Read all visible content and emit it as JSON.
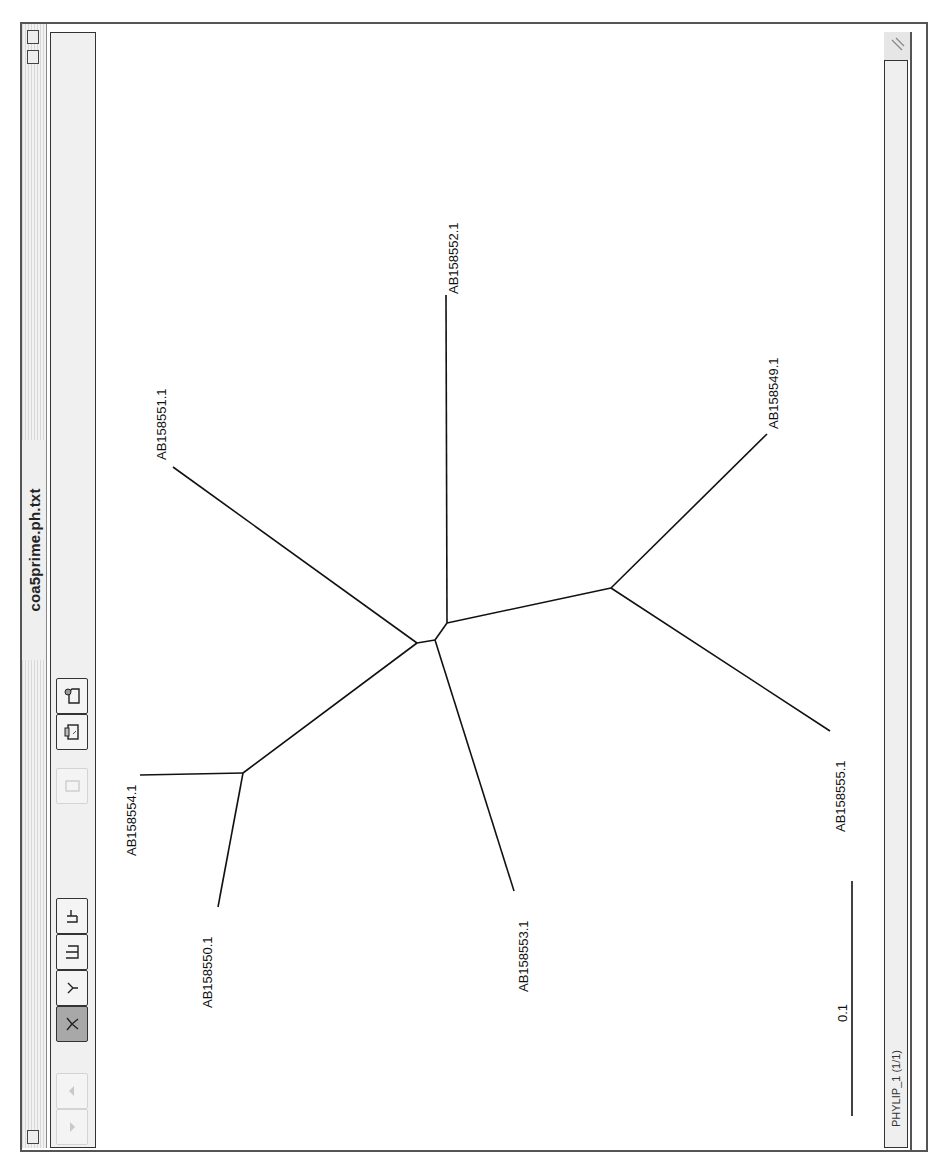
{
  "window": {
    "title": "coa5prime.ph.txt",
    "orientation": "rotated 90deg clockwise"
  },
  "toolbar": {
    "buttons": [
      {
        "name": "scroll-up",
        "icon": "triangle-up-icon",
        "state": "disabled"
      },
      {
        "name": "scroll-down",
        "icon": "triangle-down-icon",
        "state": "disabled"
      },
      {
        "name": "unrooted-tree-view",
        "icon": "unrooted-tree-icon",
        "state": "active"
      },
      {
        "name": "radial-tree-view",
        "icon": "radial-tree-icon",
        "state": "normal"
      },
      {
        "name": "rectangular-tree-view",
        "icon": "rectangle-tree-icon",
        "state": "normal"
      },
      {
        "name": "slanted-tree-view",
        "icon": "slanted-tree-icon",
        "state": "normal"
      },
      {
        "name": "copy",
        "icon": "clipboard-icon",
        "state": "disabled"
      },
      {
        "name": "print",
        "icon": "printer-icon",
        "state": "normal"
      },
      {
        "name": "save-graphic",
        "icon": "document-save-icon",
        "state": "normal"
      }
    ]
  },
  "tree": {
    "type": "unrooted",
    "leaves": [
      {
        "label": "AB158552.1"
      },
      {
        "label": "AB158551.1"
      },
      {
        "label": "AB158549.1"
      },
      {
        "label": "AB158555.1"
      },
      {
        "label": "AB158554.1"
      },
      {
        "label": "AB158550.1"
      },
      {
        "label": "AB158553.1"
      }
    ],
    "scale_bar_label": "0.1"
  },
  "status": {
    "text": "PHYLIP_1  (1/1)"
  },
  "colors": {
    "frame": "#555555",
    "toolbar_bg": "#f0f0f0",
    "active_button": "#a8a8a8",
    "branch": "#111111"
  }
}
